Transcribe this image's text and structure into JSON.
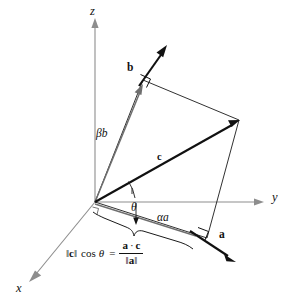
{
  "figure": {
    "kind": "vector-projection-3d-diagram",
    "background_color": "#ffffff",
    "axes": {
      "x_label": "x",
      "y_label": "y",
      "z_label": "z",
      "axis_color": "#8d8d8d",
      "origin_label": ""
    },
    "vectors": {
      "a_label": "a",
      "b_label": "b",
      "c_label": "c",
      "a_color": "#111111",
      "b_color": "#111111",
      "c_color": "#111111"
    },
    "components": {
      "alpha_a_label": "αa",
      "beta_b_label": "βb",
      "theta_label": "θ"
    },
    "formula": {
      "lhs_norm_open": "‖",
      "lhs_vector": "c",
      "lhs_norm_close": "‖",
      "cos_text": "cos",
      "theta_text": "θ",
      "equals": "=",
      "numerator_left": "a",
      "numerator_dot": "·",
      "numerator_right": "c",
      "denominator_norm_open": "‖",
      "denominator_vector": "a",
      "denominator_norm_close": "‖",
      "plain": "‖c‖ cos θ = (a · c) / ‖a‖"
    },
    "markers": {
      "right_angle_b": "right-angle",
      "right_angle_a": "right-angle",
      "brace": "under-brace-projection"
    }
  }
}
